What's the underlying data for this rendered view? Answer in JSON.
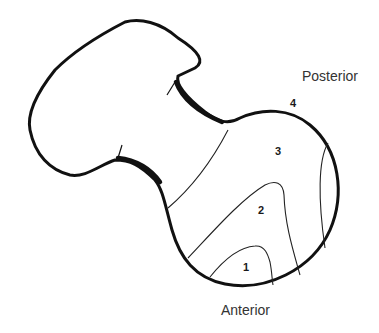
{
  "diagram": {
    "labels": {
      "posterior": "Posterior",
      "anterior": "Anterior"
    },
    "regions": [
      {
        "id": "1",
        "label": "1"
      },
      {
        "id": "2",
        "label": "2"
      },
      {
        "id": "3",
        "label": "3"
      },
      {
        "id": "4",
        "label": "4"
      }
    ],
    "colors": {
      "outline": "#111111",
      "contour": "#222222",
      "background": "#ffffff"
    }
  }
}
